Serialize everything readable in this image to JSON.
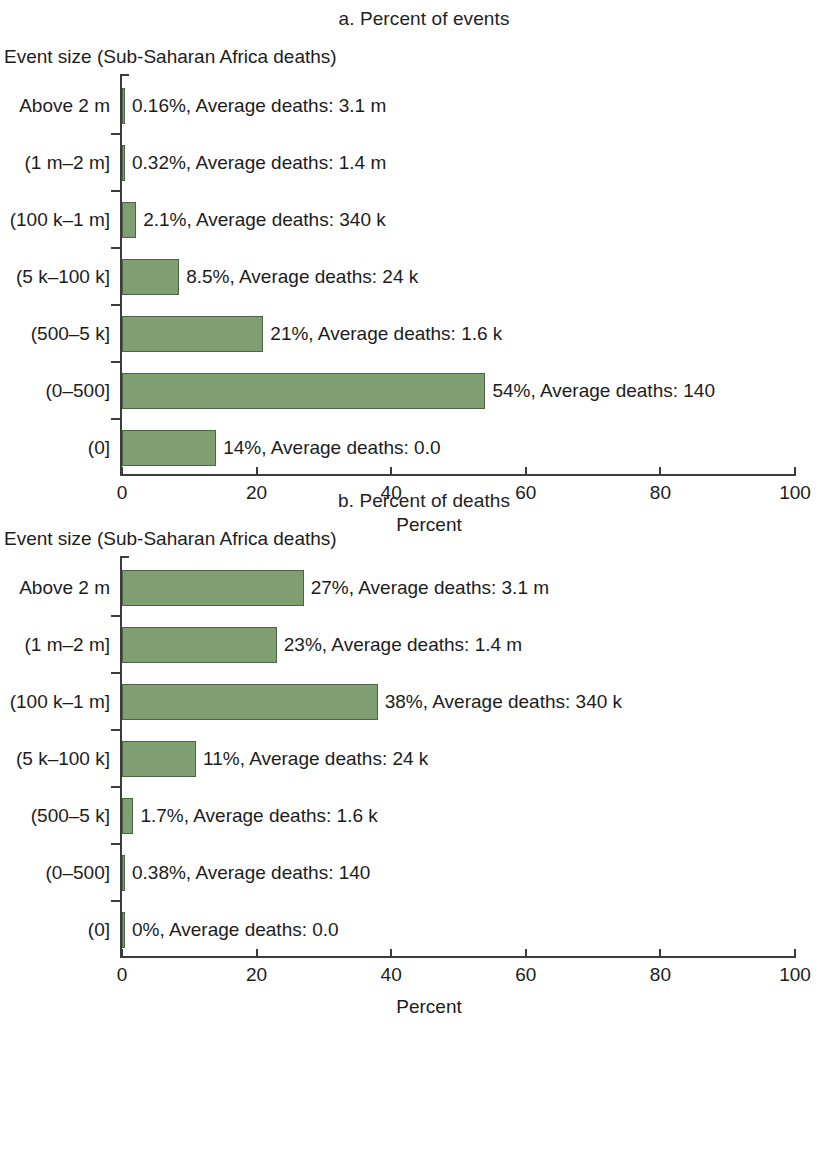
{
  "chart_data": [
    {
      "type": "bar",
      "title": "a. Percent of events",
      "ylabel": "Event size (Sub-Saharan Africa deaths)",
      "xlabel": "Percent",
      "xlim": [
        0,
        100
      ],
      "xticks": [
        "0",
        "20",
        "40",
        "60",
        "80",
        "100"
      ],
      "grid": false,
      "legend": "none",
      "orientation": "horizontal",
      "bar_color": "#7f9f72",
      "categories": [
        "Above 2 m",
        "(1 m–2 m]",
        "(100 k–1 m]",
        "(5 k–100 k]",
        "(500–5 k]",
        "(0–500]",
        "(0]"
      ],
      "values": [
        0.16,
        0.32,
        2.1,
        8.5,
        21,
        54,
        14
      ],
      "annotations": [
        "0.16%, Average deaths: 3.1 m",
        "0.32%, Average deaths: 1.4 m",
        "2.1%, Average deaths: 340 k",
        "8.5%, Average deaths: 24 k",
        "21%, Average deaths: 1.6 k",
        "54%, Average deaths: 140",
        "14%, Average deaths: 0.0"
      ],
      "average_deaths": [
        "3.1 m",
        "1.4 m",
        "340 k",
        "24 k",
        "1.6 k",
        "140",
        "0.0"
      ]
    },
    {
      "type": "bar",
      "title": "b. Percent of deaths",
      "ylabel": "Event size (Sub-Saharan Africa deaths)",
      "xlabel": "Percent",
      "xlim": [
        0,
        100
      ],
      "xticks": [
        "0",
        "20",
        "40",
        "60",
        "80",
        "100"
      ],
      "grid": false,
      "legend": "none",
      "orientation": "horizontal",
      "bar_color": "#7f9f72",
      "categories": [
        "Above 2 m",
        "(1 m–2 m]",
        "(100 k–1 m]",
        "(5 k–100 k]",
        "(500–5 k]",
        "(0–500]",
        "(0]"
      ],
      "values": [
        27,
        23,
        38,
        11,
        1.7,
        0.38,
        0
      ],
      "annotations": [
        "27%, Average deaths: 3.1 m",
        "23%, Average deaths: 1.4 m",
        "38%, Average deaths: 340 k",
        "11%, Average deaths: 24 k",
        "1.7%, Average deaths: 1.6 k",
        "0.38%, Average deaths: 140",
        "0%, Average deaths: 0.0"
      ],
      "average_deaths": [
        "3.1 m",
        "1.4 m",
        "340 k",
        "24 k",
        "1.6 k",
        "140",
        "0.0"
      ]
    }
  ]
}
